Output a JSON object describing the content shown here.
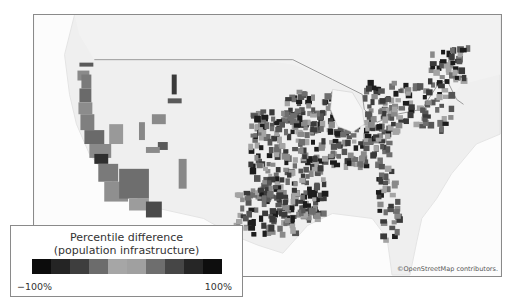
{
  "legend": {
    "title_line1": "Percentile difference",
    "title_line2": "(population infrastructure)",
    "min_label": "−100%",
    "max_label": "100%",
    "colors": [
      "#0c0c0c",
      "#242424",
      "#3e3e3e",
      "#6c6c6c",
      "#a6a6a6",
      "#a0a0a0",
      "#6e6e6e",
      "#464646",
      "#262626",
      "#0e0e0e"
    ]
  },
  "map": {
    "attribution": "©OpenStreetMap contributors.",
    "land_color": "#efefef",
    "ocean_color": "#fdfdfd"
  }
}
